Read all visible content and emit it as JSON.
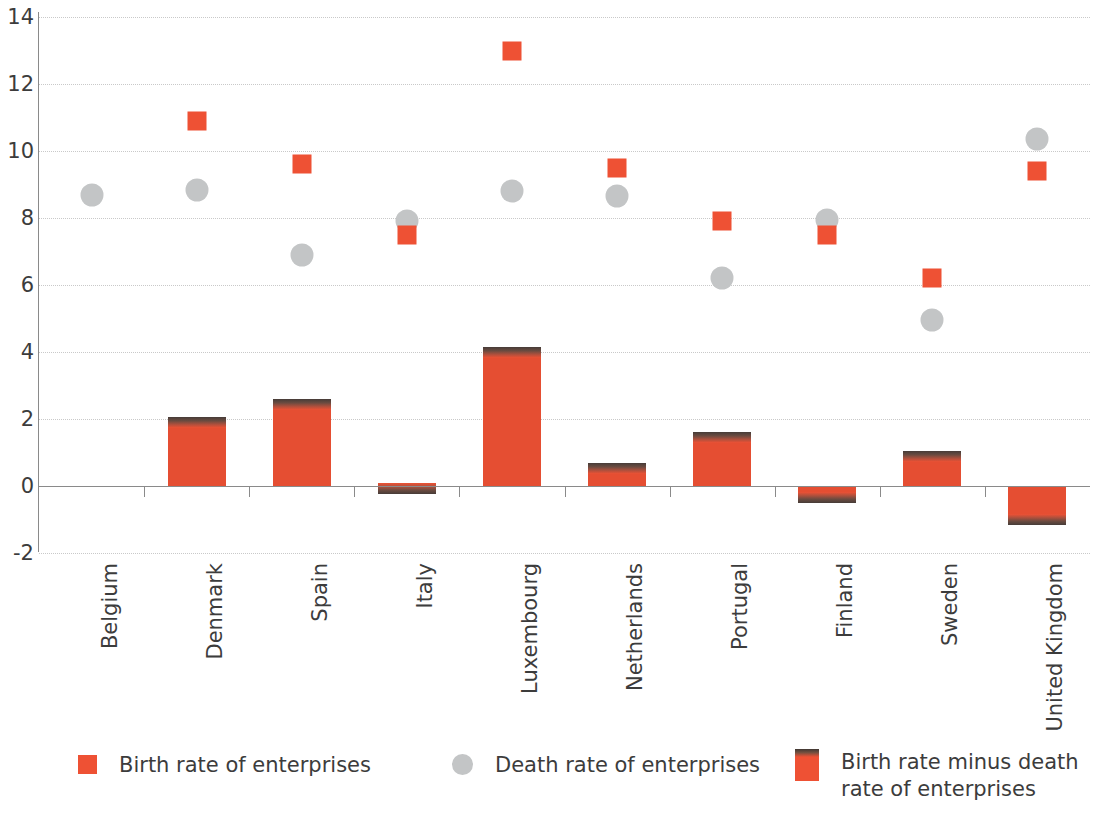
{
  "chart_data": {
    "type": "bar",
    "title": "",
    "subtitle": "",
    "xlabel": "",
    "ylabel": "",
    "ylim": [
      -2,
      14
    ],
    "yticks": [
      14,
      12,
      10,
      8,
      6,
      4,
      2,
      0,
      -2
    ],
    "grid": true,
    "legend_position": "bottom",
    "categories": [
      "Belgium",
      "Denmark",
      "Spain",
      "Italy",
      "Luxembourg",
      "Netherlands",
      "Portugal",
      "Finland",
      "Sweden",
      "United Kingdom"
    ],
    "series": [
      {
        "name": "Birth rate of enterprises",
        "marker": "square",
        "color": "#ee5134",
        "values": [
          null,
          10.9,
          9.6,
          7.5,
          13.0,
          9.5,
          7.9,
          7.5,
          6.2,
          9.4
        ]
      },
      {
        "name": "Death rate of enterprises",
        "marker": "circle",
        "color": "#c3c5c6",
        "values": [
          8.7,
          8.85,
          6.9,
          7.9,
          8.8,
          8.65,
          6.2,
          7.95,
          4.95,
          10.35
        ]
      },
      {
        "name": "Birth rate minus death rate of enterprises",
        "marker": "bar",
        "color": "#ee5134",
        "values": [
          null,
          2.05,
          2.6,
          -0.25,
          4.15,
          0.7,
          1.6,
          -0.5,
          1.05,
          -1.15
        ]
      }
    ]
  },
  "legend": {
    "items": [
      {
        "label": "Birth rate of enterprises",
        "swatch": "square-swatch"
      },
      {
        "label": "Death rate of enterprises",
        "swatch": "circle-swatch"
      },
      {
        "label": "Birth rate minus death\nrate of enterprises",
        "swatch": "bar-swatch"
      }
    ]
  },
  "axis": {
    "y_tick_labels": [
      "14",
      "12",
      "10",
      "8",
      "6",
      "4",
      "2",
      "0",
      "-2"
    ]
  }
}
